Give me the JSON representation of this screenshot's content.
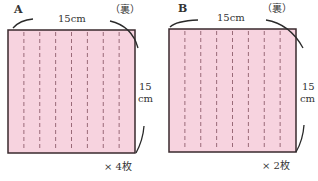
{
  "pieces": [
    {
      "id": "A",
      "label": "A",
      "side_label": "（裏）",
      "width_label": "15cm",
      "height_label_num": "15",
      "height_label_unit": "cm",
      "count_label": "× 4枚",
      "dashed_fold_lines": 7,
      "fill_color": "#f7d3df"
    },
    {
      "id": "B",
      "label": "B",
      "side_label": "（裏）",
      "width_label": "15cm",
      "height_label_num": "15",
      "height_label_unit": "cm",
      "count_label": "× 2枚",
      "dashed_fold_lines": 7,
      "fill_color": "#f7d3df"
    }
  ],
  "colors": {
    "outline": "#3a2a2e",
    "dash": "#9a6a78"
  }
}
